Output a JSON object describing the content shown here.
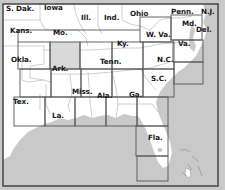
{
  "map": {
    "title": "Southeastern United States chart coverage",
    "colors": {
      "land": "#ffffff",
      "water": "#c9c9c9",
      "state_border": "#cfcfcf",
      "tile_border": "#555555",
      "highlight_tile": "#d9d9d9",
      "frame": "#444444",
      "label": "#1a1a1a"
    },
    "labels": [
      {
        "id": "s-dak",
        "text": "S. Dak.",
        "x": 6,
        "y": 5
      },
      {
        "id": "iowa",
        "text": "Iowa",
        "x": 44,
        "y": 4
      },
      {
        "id": "ill",
        "text": "Ill.",
        "x": 81,
        "y": 14
      },
      {
        "id": "ind",
        "text": "Ind.",
        "x": 104,
        "y": 14
      },
      {
        "id": "ohio",
        "text": "Ohio",
        "x": 130,
        "y": 10
      },
      {
        "id": "penn",
        "text": "Penn.",
        "x": 171,
        "y": 8
      },
      {
        "id": "nj",
        "text": "N.J.",
        "x": 201,
        "y": 8
      },
      {
        "id": "kans",
        "text": "Kans.",
        "x": 10,
        "y": 27
      },
      {
        "id": "mo",
        "text": "Mo.",
        "x": 53,
        "y": 29
      },
      {
        "id": "md",
        "text": "Md.",
        "x": 182,
        "y": 20
      },
      {
        "id": "del",
        "text": "Del.",
        "x": 196,
        "y": 26
      },
      {
        "id": "w-va",
        "text": "W. Va.",
        "x": 146,
        "y": 31
      },
      {
        "id": "ky",
        "text": "Ky.",
        "x": 117,
        "y": 40
      },
      {
        "id": "va",
        "text": "Va.",
        "x": 178,
        "y": 40
      },
      {
        "id": "okla",
        "text": "Okla.",
        "x": 11,
        "y": 56
      },
      {
        "id": "ark",
        "text": "Ark.",
        "x": 52,
        "y": 65
      },
      {
        "id": "tenn",
        "text": "Tenn.",
        "x": 100,
        "y": 58
      },
      {
        "id": "nc",
        "text": "N.C.",
        "x": 157,
        "y": 56
      },
      {
        "id": "sc",
        "text": "S.C.",
        "x": 151,
        "y": 75
      },
      {
        "id": "tex",
        "text": "Tex.",
        "x": 13,
        "y": 98
      },
      {
        "id": "miss",
        "text": "Miss.",
        "x": 72,
        "y": 88
      },
      {
        "id": "ala",
        "text": "Ala.",
        "x": 97,
        "y": 92
      },
      {
        "id": "ga",
        "text": "Ga.",
        "x": 129,
        "y": 91
      },
      {
        "id": "la",
        "text": "La.",
        "x": 52,
        "y": 112
      },
      {
        "id": "fla",
        "text": "Fla.",
        "x": 148,
        "y": 134
      }
    ]
  }
}
